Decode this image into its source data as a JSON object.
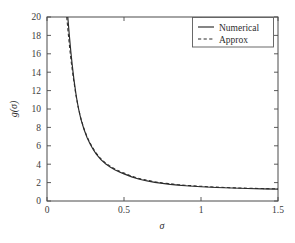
{
  "chart_data": {
    "type": "line",
    "title": "",
    "xlabel": "σ",
    "ylabel": "g(σ)",
    "xlim": [
      0,
      1.5
    ],
    "ylim": [
      0,
      20
    ],
    "grid": false,
    "legend_position": "top-right",
    "xticks": [
      0,
      0.5,
      1,
      1.5
    ],
    "xticklabels": [
      "0",
      "0.5",
      "1",
      "1.5"
    ],
    "yticks": [
      0,
      2,
      4,
      6,
      8,
      10,
      12,
      14,
      16,
      18,
      20
    ],
    "yticklabels": [
      "0",
      "2",
      "4",
      "6",
      "8",
      "10",
      "12",
      "14",
      "16",
      "18",
      "20"
    ],
    "series": [
      {
        "name": "Numerical",
        "style": "solid",
        "color": "#2b2b2b",
        "x": [
          0.135,
          0.145,
          0.155,
          0.165,
          0.175,
          0.19,
          0.205,
          0.22,
          0.24,
          0.26,
          0.28,
          0.3,
          0.32,
          0.35,
          0.38,
          0.41,
          0.44,
          0.47,
          0.5,
          0.55,
          0.6,
          0.65,
          0.7,
          0.75,
          0.8,
          0.85,
          0.9,
          0.95,
          1.0,
          1.1,
          1.2,
          1.3,
          1.4,
          1.5
        ],
        "y": [
          20.0,
          18.0,
          16.2,
          14.6,
          13.2,
          11.4,
          10.0,
          8.9,
          7.8,
          6.9,
          6.2,
          5.6,
          5.1,
          4.5,
          4.05,
          3.7,
          3.4,
          3.15,
          2.95,
          2.62,
          2.37,
          2.18,
          2.03,
          1.91,
          1.81,
          1.73,
          1.66,
          1.6,
          1.55,
          1.47,
          1.41,
          1.36,
          1.32,
          1.29
        ]
      },
      {
        "name": "Approx",
        "style": "dashed",
        "color": "#2b2b2b",
        "x": [
          0.128,
          0.138,
          0.148,
          0.158,
          0.17,
          0.185,
          0.2,
          0.215,
          0.235,
          0.255,
          0.275,
          0.295,
          0.315,
          0.345,
          0.375,
          0.405,
          0.435,
          0.465,
          0.495,
          0.545,
          0.595,
          0.645,
          0.695,
          0.745,
          0.795,
          0.845,
          0.895,
          0.945,
          1.0,
          1.1,
          1.2,
          1.3,
          1.4,
          1.5
        ],
        "y": [
          20.0,
          18.2,
          16.5,
          15.0,
          13.5,
          11.8,
          10.4,
          9.3,
          8.1,
          7.2,
          6.45,
          5.85,
          5.3,
          4.68,
          4.2,
          3.84,
          3.54,
          3.28,
          3.07,
          2.73,
          2.47,
          2.27,
          2.11,
          1.98,
          1.88,
          1.79,
          1.72,
          1.66,
          1.6,
          1.51,
          1.44,
          1.39,
          1.35,
          1.32
        ]
      }
    ],
    "legend_entries": [
      {
        "label": "Numerical",
        "style": "solid"
      },
      {
        "label": "Approx",
        "style": "dashed"
      }
    ],
    "axis_color": "#4a4a4a"
  }
}
